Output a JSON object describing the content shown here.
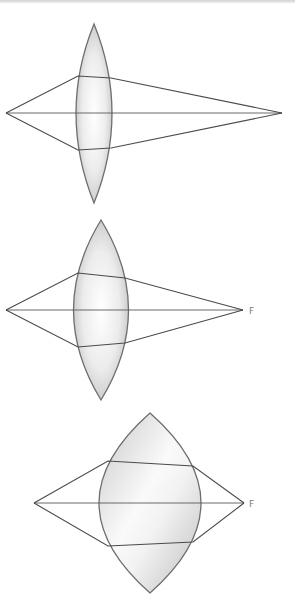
{
  "figure": {
    "colors": {
      "lens_stroke": "#6e6e6e",
      "ray": "#4a4a4a",
      "lens_fill_dark": "#c4c4c4",
      "lens_fill_light": "#fbfbfb",
      "label": "#7a7a7a"
    },
    "diagrams": [
      {
        "name": "thin-lens",
        "focal_label": ""
      },
      {
        "name": "medium-lens",
        "focal_label": "F"
      },
      {
        "name": "thick-lens",
        "focal_label": "F"
      }
    ]
  }
}
